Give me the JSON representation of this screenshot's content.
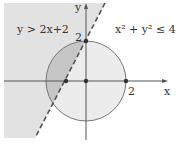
{
  "labels": {
    "inequality_line": "y > 2x+2",
    "inequality_circle": "x² + y² ≤ 4",
    "x_axis": "x",
    "y_axis": "y",
    "tick_x_2": "2",
    "tick_y_2": "2"
  },
  "geometry": {
    "circle_radius": 2,
    "line_slope": 2,
    "line_intercept": 2,
    "marked_points": [
      [
        0,
        2
      ],
      [
        -1,
        0
      ],
      [
        0,
        0
      ],
      [
        2,
        0
      ]
    ]
  },
  "colors": {
    "halfplane": "#e2e2e2",
    "disk": "#ececec",
    "overlap": "#c4c4c4",
    "stroke": "#666666"
  }
}
